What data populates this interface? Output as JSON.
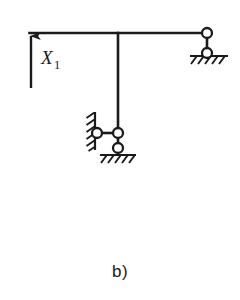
{
  "figure": {
    "caption": "b)",
    "type": "structural-mechanics-diagram",
    "background_color": "#ffffff",
    "line_color": "#1a1a1a",
    "node_fill_color": "#ffffff"
  },
  "force": {
    "label_base": "X",
    "label_subscript": "1",
    "direction": "up",
    "arrow": {
      "x": 31,
      "y_tail": 88,
      "y_head": 33
    },
    "label_position": {
      "x": 41,
      "y": 62
    }
  },
  "members": {
    "beam": {
      "x1": 30,
      "y1": 33,
      "x2": 207,
      "y2": 33,
      "orientation": "horizontal"
    },
    "column": {
      "x1": 118,
      "y1": 33,
      "x2": 118,
      "y2": 133,
      "orientation": "vertical"
    },
    "right_link": {
      "x1": 207,
      "y1": 33,
      "x2": 207,
      "y2": 53,
      "orientation": "vertical"
    },
    "lower_link": {
      "x1": 97,
      "y1": 133,
      "x2": 118,
      "y2": 133,
      "orientation": "horizontal"
    },
    "lower_drop": {
      "x1": 118,
      "y1": 133,
      "x2": 118,
      "y2": 148,
      "orientation": "vertical"
    }
  },
  "nodes": [
    {
      "name": "right-beam-hinge",
      "cx": 207,
      "cy": 33,
      "r": 5
    },
    {
      "name": "right-ground-hinge",
      "cx": 207,
      "cy": 53,
      "r": 5
    },
    {
      "name": "wall-hinge",
      "cx": 97,
      "cy": 133,
      "r": 5
    },
    {
      "name": "column-base-hinge",
      "cx": 118,
      "cy": 133,
      "r": 5
    },
    {
      "name": "lower-ground-hinge",
      "cx": 118,
      "cy": 148,
      "r": 5
    }
  ],
  "supports": [
    {
      "name": "right-ground-support",
      "kind": "hatched-ground",
      "x1": 190,
      "x2": 228,
      "y": 56
    },
    {
      "name": "lower-ground-support",
      "kind": "hatched-ground",
      "x1": 100,
      "x2": 136,
      "y": 155
    },
    {
      "name": "left-wall-support",
      "kind": "hatched-wall",
      "x": 95,
      "y1": 112,
      "y2": 150
    }
  ]
}
